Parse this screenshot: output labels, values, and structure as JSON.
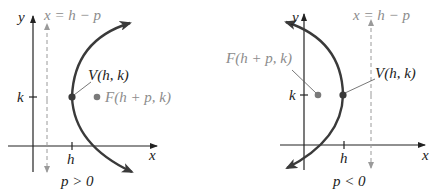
{
  "colors": {
    "axis": "#222222",
    "curve": "#3a3a3a",
    "vertex": "#3a3a3a",
    "focus": "#7a7a7a",
    "directrix": "#9a9a9a",
    "label_gray": "#8c8c8c",
    "label_dark": "#222222"
  },
  "panels": [
    {
      "id": "p-positive",
      "axis_y_label": "y",
      "axis_x_label": "x",
      "directrix_label": "x = h − p",
      "vertex_label": "V(h, k)",
      "focus_label": "F(h + p, k)",
      "k_tick_label": "k",
      "h_tick_label": "h",
      "caption": "p > 0"
    },
    {
      "id": "p-negative",
      "axis_y_label": "y",
      "axis_x_label": "x",
      "directrix_label": "x = h − p",
      "vertex_label": "V(h, k)",
      "focus_label": "F(h + p, k)",
      "k_tick_label": "k",
      "h_tick_label": "h",
      "caption": "p < 0"
    }
  ]
}
